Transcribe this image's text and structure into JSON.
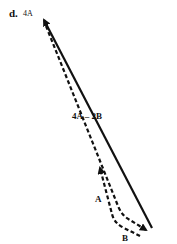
{
  "figure": {
    "panel_label": "d.",
    "labels": {
      "vector_4a": "4A",
      "vector_difference": "4A – 2B",
      "vector_a": "A",
      "vector_b": "B"
    },
    "colors": {
      "stroke": "#111111",
      "background": "#ffffff"
    }
  }
}
